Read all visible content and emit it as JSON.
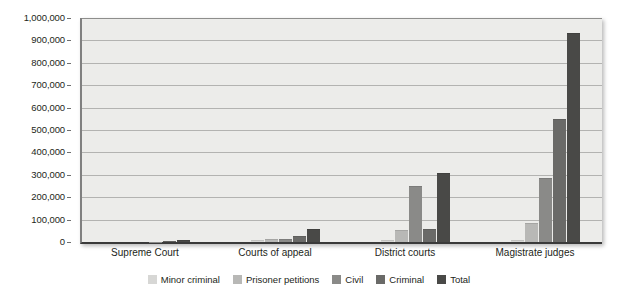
{
  "chart_data": {
    "type": "bar",
    "title": "",
    "subtitle": "",
    "xlabel": "",
    "ylabel": "",
    "categories": [
      "Supreme Court",
      "Courts of appeal",
      "District courts",
      "Magistrate judges"
    ],
    "series": [
      {
        "name": "Minor criminal",
        "color": "#d7d7d5",
        "values": [
          0,
          7000,
          10000,
          10000
        ]
      },
      {
        "name": "Prisoner petitions",
        "color": "#b8b8b6",
        "values": [
          0,
          12000,
          55000,
          85000
        ]
      },
      {
        "name": "Civil",
        "color": "#8a8a88",
        "values": [
          2000,
          15000,
          250000,
          285000
        ]
      },
      {
        "name": "Criminal",
        "color": "#6a6a68",
        "values": [
          5000,
          25000,
          60000,
          550000
        ]
      },
      {
        "name": "Total",
        "color": "#494947",
        "values": [
          8000,
          60000,
          310000,
          935000
        ]
      }
    ],
    "ylim": [
      0,
      1000000
    ],
    "ytick_step": 100000,
    "ytick_labels": [
      "1,000,000",
      "900,000",
      "800,000",
      "700,000",
      "600,000",
      "500,000",
      "400,000",
      "300,000",
      "200,000",
      "100,000",
      "0"
    ],
    "ytick_values": [
      1000000,
      900000,
      800000,
      700000,
      600000,
      500000,
      400000,
      300000,
      200000,
      100000,
      0
    ],
    "grid": true,
    "grid_orientation": "horizontal",
    "legend_position": "bottom",
    "plot_background": "#ececea",
    "axis_color": "#3a3a3a",
    "gridline_color": "#b3b3b1",
    "text_color": "#231f20"
  },
  "legend": {
    "items": [
      {
        "label": "Minor criminal",
        "color": "#d7d7d5"
      },
      {
        "label": "Prisoner petitions",
        "color": "#b8b8b6"
      },
      {
        "label": "Civil",
        "color": "#8a8a88"
      },
      {
        "label": "Criminal",
        "color": "#6a6a68"
      },
      {
        "label": "Total",
        "color": "#494947"
      }
    ]
  }
}
